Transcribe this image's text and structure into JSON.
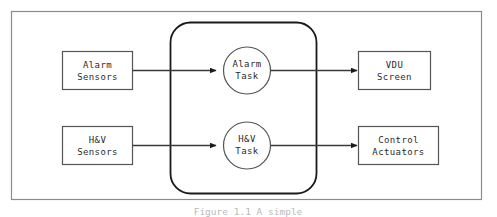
{
  "figure": {
    "outer_frame_color": "#8c8c8c",
    "shape_stroke_color": "#555555",
    "group_stroke_color": "#1a1a1a",
    "arrow_color": "#3a3a3a",
    "text_color": "#2b2b2b",
    "background": "#ffffff"
  },
  "caption": {
    "text": "Figure 1.1  A simple"
  },
  "input_nodes": [
    {
      "id": "alarm-sensors",
      "line1": "Alarm",
      "line2": "Sensors"
    },
    {
      "id": "hv-sensors",
      "line1": "H&V",
      "line2": "Sensors"
    }
  ],
  "task_nodes": [
    {
      "id": "alarm-task",
      "line1": "Alarm",
      "line2": "Task"
    },
    {
      "id": "hv-task",
      "line1": "H&V",
      "line2": "Task"
    }
  ],
  "output_nodes": [
    {
      "id": "vdu-screen",
      "line1": "VDU",
      "line2": "Screen"
    },
    {
      "id": "control-actuators",
      "line1": "Control",
      "line2": "Actuators"
    }
  ]
}
